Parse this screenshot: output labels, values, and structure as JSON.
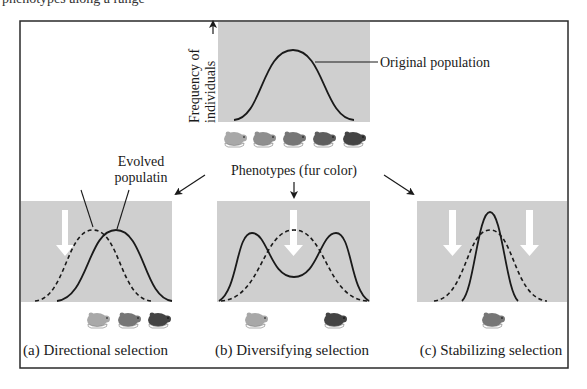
{
  "top_cutoff_text": "phenotypes along a range",
  "colors": {
    "panel_gray": "#cfcfcf",
    "curve": "#1a1a1a",
    "frame": "#2a2a2a",
    "selection_arrow": "#ffffff",
    "mouse_shades": [
      "#a8a8a8",
      "#8e8e8e",
      "#767676",
      "#5e5e5e",
      "#444444"
    ]
  },
  "original": {
    "y_axis_label_line1": "Frequency of",
    "y_axis_label_line2": "individuals",
    "callout": "Original population",
    "x_axis_label": "Phenotypes (fur color)",
    "mice_count": 5
  },
  "panels": [
    {
      "id": "a",
      "caption": "(a) Directional selection",
      "callout_line1": "Evolved",
      "callout_line2": "populatin",
      "selection_arrows": 1,
      "mice": [
        "light",
        "medium",
        "dark"
      ]
    },
    {
      "id": "b",
      "caption": "(b) Diversifying selection",
      "selection_arrows": 1,
      "mice": [
        "light",
        "dark"
      ]
    },
    {
      "id": "c",
      "caption": "(c) Stabilizing selection",
      "selection_arrows": 2,
      "mice": [
        "medium"
      ]
    }
  ],
  "legend": {
    "solid_line": "Evolved population",
    "dashed_line": "Original population"
  }
}
